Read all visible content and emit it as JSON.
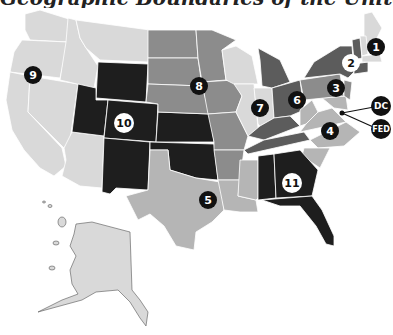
{
  "title": "Geographic Boundaries of the United States Courts of Appeals",
  "colors": {
    "lightest": "#d9d9d9",
    "light": "#b5b5b5",
    "medium": "#8c8c8c",
    "dark": "#5c5c5c",
    "darkest": "#1e1e1e",
    "badge_dark": "#111111",
    "badge_light": "#ffffff",
    "border": "#ffffff"
  },
  "circuits": [
    {
      "id": "1",
      "label": "1"
    },
    {
      "id": "2",
      "label": "2"
    },
    {
      "id": "3",
      "label": "3"
    },
    {
      "id": "4",
      "label": "4"
    },
    {
      "id": "5",
      "label": "5"
    },
    {
      "id": "6",
      "label": "6"
    },
    {
      "id": "7",
      "label": "7"
    },
    {
      "id": "8",
      "label": "8"
    },
    {
      "id": "9",
      "label": "9"
    },
    {
      "id": "10",
      "label": "10"
    },
    {
      "id": "11",
      "label": "11"
    },
    {
      "id": "dc",
      "label": "DC"
    },
    {
      "id": "fed",
      "label": "FED"
    }
  ]
}
